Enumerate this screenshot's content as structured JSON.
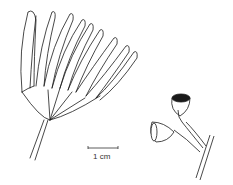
{
  "illustration": {
    "subject": "botanical line drawing: flower bud cluster and fruits",
    "scale_bar": {
      "label": "1 cm"
    },
    "colors": {
      "ink": "#1a1a1a",
      "background": "#ffffff"
    }
  }
}
